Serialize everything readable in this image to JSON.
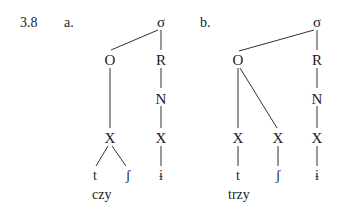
{
  "example_number": "3.8",
  "trees": [
    {
      "label": "a.",
      "word": "czy",
      "nodes": {
        "sigma": "σ",
        "onset": "O",
        "rhyme": "R",
        "nucleus": "N",
        "x1": "X",
        "x2": "X",
        "seg1": "t",
        "seg2": "ʃ",
        "seg3": "ɨ"
      }
    },
    {
      "label": "b.",
      "word": "trzy",
      "nodes": {
        "sigma": "σ",
        "onset": "O",
        "rhyme": "R",
        "nucleus": "N",
        "x1": "X",
        "x2": "X",
        "x3": "X",
        "seg1": "t",
        "seg2": "ʃ",
        "seg3": "ɨ"
      }
    }
  ]
}
